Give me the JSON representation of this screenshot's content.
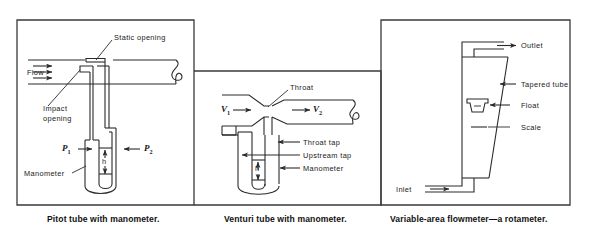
{
  "figure": {
    "panels": [
      {
        "id": "pitot",
        "caption": "Pitot tube with manometer.",
        "labels": {
          "static_opening": "Static  opening",
          "flow": "Flow",
          "impact_opening_line1": "Impact",
          "impact_opening_line2": "opening",
          "manometer": "Manometer",
          "p1": "P",
          "p1_sub": "1",
          "p2": "P",
          "p2_sub": "2",
          "h": "h"
        }
      },
      {
        "id": "venturi",
        "caption": "Venturi tube with manometer.",
        "labels": {
          "throat": "Throat",
          "throat_tap": "Throat tap",
          "upstream_tap": "Upstream tap",
          "manometer": "Manometer",
          "v1": "V",
          "v1_sub": "1",
          "v2": "V",
          "v2_sub": "2",
          "h": "h"
        }
      },
      {
        "id": "rotameter",
        "caption": "Variable-area flowmeter—a rotameter.",
        "labels": {
          "outlet": "Outlet",
          "tapered_tube": "Tapered tube",
          "float": "Float",
          "scale": "Scale",
          "inlet": "Inlet"
        }
      }
    ],
    "colors": {
      "ink": "#2a2a2a",
      "frame": "#3a3a3a",
      "background": "#ffffff"
    }
  }
}
